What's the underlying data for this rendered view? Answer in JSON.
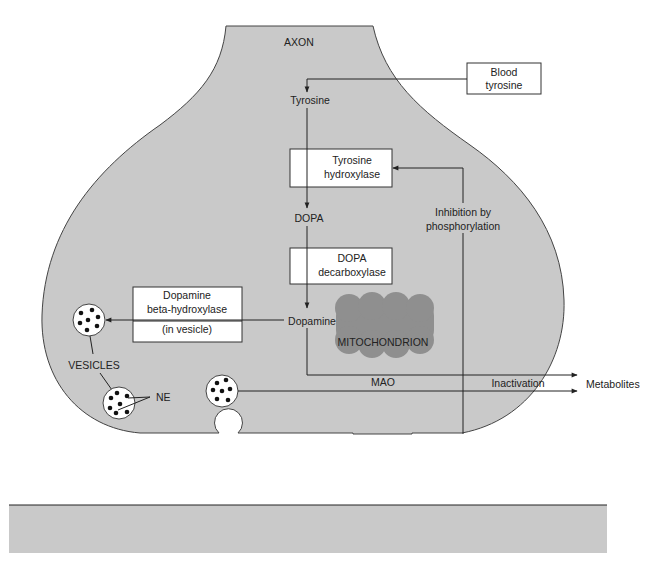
{
  "diagram": {
    "colors": {
      "cell_fill": "#c9c9c9",
      "mitochondrion_fill": "#8f8f8f",
      "postsynaptic_fill": "#c9c9c9",
      "line": "#222222",
      "box_fill": "#ffffff"
    },
    "labels": {
      "axon": "AXON",
      "blood_tyrosine_1": "Blood",
      "blood_tyrosine_2": "tyrosine",
      "tyrosine": "Tyrosine",
      "tyrosine_hydroxylase_1": "Tyrosine",
      "tyrosine_hydroxylase_2": "hydroxylase",
      "dopa": "DOPA",
      "dopa_decarboxylase_1": "DOPA",
      "dopa_decarboxylase_2": "decarboxylase",
      "dopamine": "Dopamine",
      "dbh_1": "Dopamine",
      "dbh_2": "beta-hydroxylase",
      "dbh_3": "(in vesicle)",
      "inhibition_1": "Inhibition by",
      "inhibition_2": "phosphorylation",
      "mitochondrion": "MITOCHONDRION",
      "mao": "MAO",
      "inactivation_mao": "Inactivation",
      "metabolites_mao": "Metabolites",
      "vesicles": "VESICLES",
      "ne": "NE",
      "reuptake_1": "Reuptake",
      "reuptake_2": "mechanism",
      "protein_kinase": "Protein kinase",
      "atp": "ATP",
      "camp": "cAMP",
      "presynaptic_1": "PRESYNAPTIC",
      "presynaptic_2": "RECEPTOR",
      "comt": "COMT",
      "inactivation_comt": "Inactivation",
      "metabolites_comt": "Metabolites",
      "receptor": "Receptor"
    },
    "nodes": [
      {
        "id": "blood-tyrosine",
        "label": "Blood tyrosine",
        "type": "box"
      },
      {
        "id": "tyrosine",
        "label": "Tyrosine",
        "type": "text"
      },
      {
        "id": "tyrosine-hydroxylase",
        "label": "Tyrosine hydroxylase",
        "type": "box"
      },
      {
        "id": "dopa",
        "label": "DOPA",
        "type": "text"
      },
      {
        "id": "dopa-decarboxylase",
        "label": "DOPA decarboxylase",
        "type": "box"
      },
      {
        "id": "dopamine",
        "label": "Dopamine",
        "type": "text"
      },
      {
        "id": "dbh",
        "label": "Dopamine beta-hydroxylase (in vesicle)",
        "type": "box"
      },
      {
        "id": "mitochondrion",
        "label": "MITOCHONDRION / MAO",
        "type": "organelle"
      },
      {
        "id": "protein-kinase",
        "label": "Protein kinase",
        "type": "box"
      },
      {
        "id": "presynaptic-receptor",
        "label": "PRESYNAPTIC RECEPTOR",
        "type": "box"
      },
      {
        "id": "comt",
        "label": "COMT",
        "type": "box"
      },
      {
        "id": "receptor",
        "label": "Receptor",
        "type": "box"
      }
    ],
    "edges": [
      {
        "from": "blood-tyrosine",
        "to": "tyrosine"
      },
      {
        "from": "tyrosine",
        "to": "dopa",
        "via": "tyrosine-hydroxylase"
      },
      {
        "from": "dopa",
        "to": "dopamine",
        "via": "dopa-decarboxylase"
      },
      {
        "from": "dopamine",
        "to": "vesicle",
        "via": "dbh"
      },
      {
        "from": "dopamine",
        "to": "metabolites",
        "via": "mitochondrion",
        "label": "Inactivation"
      },
      {
        "from": "vesicle",
        "to": "metabolites",
        "via": "mitochondrion"
      },
      {
        "from": "ATP",
        "to": "cAMP",
        "via": "presynaptic-receptor"
      },
      {
        "from": "cAMP",
        "to": "protein-kinase"
      },
      {
        "from": "protein-kinase",
        "to": "tyrosine-hydroxylase",
        "label": "Inhibition by phosphorylation"
      },
      {
        "from": "synaptic-NE",
        "to": "vesicle",
        "label": "Reuptake mechanism"
      },
      {
        "from": "synaptic-NE",
        "to": "receptor"
      },
      {
        "from": "synaptic-NE",
        "to": "metabolites",
        "via": "comt",
        "label": "Inactivation"
      }
    ]
  }
}
